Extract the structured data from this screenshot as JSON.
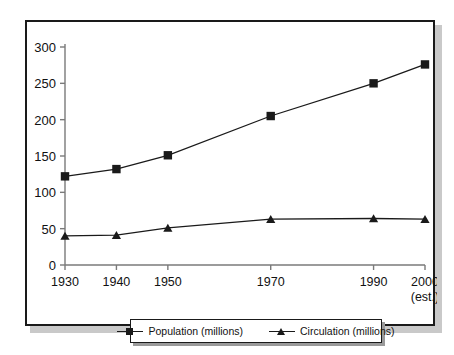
{
  "chart_data": {
    "type": "line",
    "title": "",
    "xlabel": "",
    "ylabel": "",
    "categories": [
      "1930",
      "1940",
      "1950",
      "1970",
      "1990",
      "2000\n(est.)"
    ],
    "x_tick_labels": [
      "1930",
      "1940",
      "1950",
      "1970",
      "1990",
      "2000"
    ],
    "x_tick_sublabel_last": "(est.)",
    "y_tick_labels": [
      "0",
      "50",
      "100",
      "150",
      "200",
      "250",
      "300"
    ],
    "y_tick_values": [
      0,
      50,
      100,
      150,
      200,
      250,
      300
    ],
    "ylim": [
      0,
      300
    ],
    "grid": false,
    "legend_position": "bottom",
    "series": [
      {
        "name": "Population (millions)",
        "marker": "square",
        "color": "#1a1a1a",
        "values": [
          122,
          132,
          151,
          205,
          250,
          276
        ]
      },
      {
        "name": "Circulation (millions)",
        "marker": "triangle",
        "color": "#1a1a1a",
        "values": [
          40,
          41,
          51,
          63,
          64,
          63
        ]
      }
    ]
  },
  "legend": {
    "items": [
      {
        "label": "Population (millions)",
        "marker": "square-marker-icon"
      },
      {
        "label": "Circulation (millions)",
        "marker": "triangle-marker-icon"
      }
    ]
  },
  "colors": {
    "line": "#1a1a1a",
    "axis": "#7a7a7a",
    "frame": "#1a1a1a",
    "shadow": "#c9c9c9",
    "background": "#ffffff"
  }
}
